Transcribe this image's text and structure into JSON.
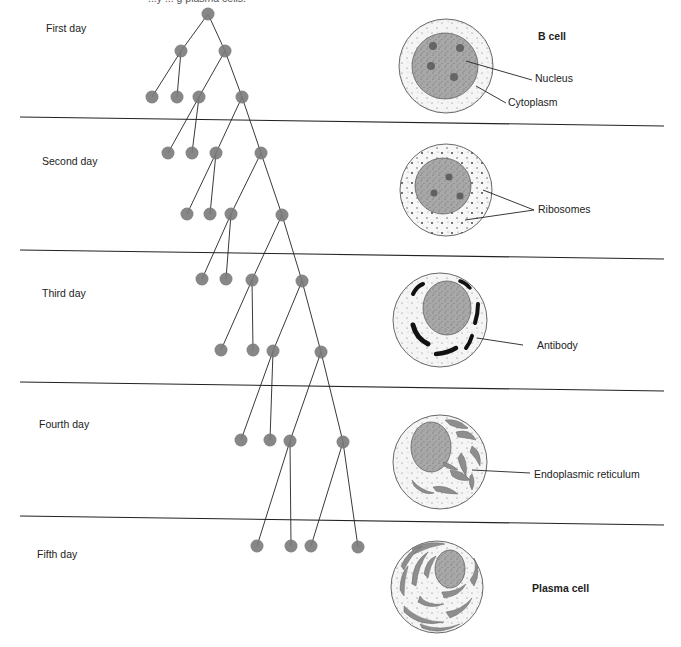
{
  "caption_fragment": "...y ... g plasma cells.",
  "days": [
    {
      "label": "First day",
      "x": 46,
      "y": 22
    },
    {
      "label": "Second day",
      "x": 42,
      "y": 155
    },
    {
      "label": "Third day",
      "x": 42,
      "y": 287
    },
    {
      "label": "Fourth day",
      "x": 39,
      "y": 418
    },
    {
      "label": "Fifth day",
      "x": 37,
      "y": 548
    }
  ],
  "separators": [
    117,
    250,
    382,
    516
  ],
  "cell_stages": [
    {
      "name": "b-cell",
      "title": "B cell",
      "labels": [
        "Nucleus",
        "Cytoplasm"
      ]
    },
    {
      "name": "day2-cell",
      "labels": [
        "Ribosomes"
      ]
    },
    {
      "name": "day3-cell",
      "labels": [
        "Antibody"
      ]
    },
    {
      "name": "day4-cell",
      "labels": [
        "Endoplasmic reticulum"
      ]
    },
    {
      "name": "plasma-cell",
      "title": "Plasma cell"
    }
  ],
  "labels": {
    "b_cell": "B cell",
    "nucleus": "Nucleus",
    "cytoplasm": "Cytoplasm",
    "ribosomes": "Ribosomes",
    "antibody": "Antibody",
    "er": "Endoplasmic reticulum",
    "plasma_cell": "Plasma cell"
  },
  "colors": {
    "node_fill": "#7a7a7a",
    "nucleus_fill": "#a9a9a9",
    "cytoplasm_fill": "#f4f4f4",
    "line": "#222222",
    "antibody": "#111111",
    "er_fill": "#8e8e8e"
  },
  "tree": {
    "nodes": [
      [
        208,
        14
      ],
      [
        181,
        51
      ],
      [
        225,
        51
      ],
      [
        152,
        97
      ],
      [
        177,
        97
      ],
      [
        199,
        97
      ],
      [
        242,
        97
      ],
      [
        168,
        153
      ],
      [
        192,
        153
      ],
      [
        216,
        153
      ],
      [
        261,
        153
      ],
      [
        187,
        214
      ],
      [
        210,
        214
      ],
      [
        231,
        214
      ],
      [
        282,
        215
      ],
      [
        202,
        279
      ],
      [
        226,
        279
      ],
      [
        252,
        280
      ],
      [
        302,
        281
      ],
      [
        221,
        350
      ],
      [
        253,
        350
      ],
      [
        273,
        351
      ],
      [
        321,
        352
      ],
      [
        241,
        440
      ],
      [
        270,
        440
      ],
      [
        290,
        441
      ],
      [
        343,
        442
      ],
      [
        257,
        546
      ],
      [
        291,
        546
      ],
      [
        311,
        546
      ],
      [
        358,
        547
      ]
    ],
    "edges": [
      [
        0,
        1
      ],
      [
        0,
        2
      ],
      [
        1,
        3
      ],
      [
        1,
        4
      ],
      [
        2,
        5
      ],
      [
        2,
        6
      ],
      [
        5,
        7
      ],
      [
        5,
        8
      ],
      [
        6,
        9
      ],
      [
        6,
        10
      ],
      [
        9,
        11
      ],
      [
        9,
        12
      ],
      [
        10,
        13
      ],
      [
        10,
        14
      ],
      [
        13,
        15
      ],
      [
        13,
        16
      ],
      [
        14,
        17
      ],
      [
        14,
        18
      ],
      [
        17,
        19
      ],
      [
        17,
        20
      ],
      [
        18,
        21
      ],
      [
        18,
        22
      ],
      [
        21,
        23
      ],
      [
        21,
        24
      ],
      [
        22,
        25
      ],
      [
        22,
        26
      ],
      [
        25,
        27
      ],
      [
        25,
        28
      ],
      [
        26,
        29
      ],
      [
        26,
        30
      ]
    ]
  }
}
